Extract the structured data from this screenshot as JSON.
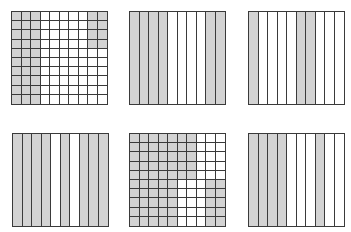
{
  "diagram": {
    "fill_color": "#d3d3d3",
    "line_color": "#3a3a3a",
    "figures": [
      {
        "id": "grid-1",
        "type": "hundredths",
        "rows": 10,
        "cols": 10,
        "position": {
          "left": 11,
          "top": 11
        },
        "shaded_cells": "cols 1-3 all rows; cols 9-10 rows 1-4",
        "shaded_count": 38,
        "total": 100
      },
      {
        "id": "grid-2",
        "type": "tenths",
        "rows": 1,
        "cols": 10,
        "position": {
          "left": 129,
          "top": 11
        },
        "shaded_columns": [
          1,
          2,
          3,
          4,
          9,
          10
        ],
        "shaded_count": 6,
        "total": 10
      },
      {
        "id": "grid-3",
        "type": "tenths",
        "rows": 1,
        "cols": 10,
        "position": {
          "left": 248,
          "top": 11
        },
        "shaded_columns": [
          1,
          6,
          7
        ],
        "shaded_count": 3,
        "total": 10
      },
      {
        "id": "grid-4",
        "type": "tenths",
        "rows": 1,
        "cols": 10,
        "position": {
          "left": 12,
          "top": 133
        },
        "shaded_columns": [
          1,
          2,
          3,
          4,
          6,
          8,
          9,
          10
        ],
        "shaded_count": 8,
        "total": 10
      },
      {
        "id": "grid-5",
        "type": "hundredths",
        "rows": 10,
        "cols": 10,
        "position": {
          "left": 129,
          "top": 133
        },
        "shaded_cells": "rows 1-5 cols 1-7; rows 6-10 cols 1-5 and 9-10",
        "shaded_count": 70,
        "total": 100
      },
      {
        "id": "grid-6",
        "type": "tenths",
        "rows": 1,
        "cols": 10,
        "position": {
          "left": 248,
          "top": 133
        },
        "shaded_columns": [
          1,
          2,
          3,
          4,
          8
        ],
        "shaded_count": 5,
        "total": 10
      }
    ]
  }
}
